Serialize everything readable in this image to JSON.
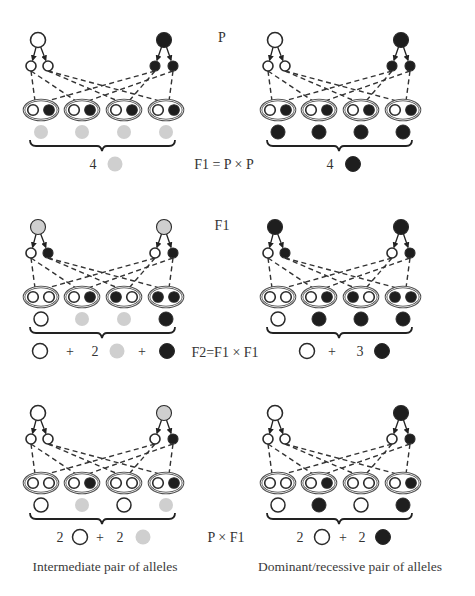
{
  "colors": {
    "white": "#ffffff",
    "grey": "#cfcfcf",
    "black": "#1e1e1e",
    "outline": "#2a2a2a",
    "ellipse_outline": "#4a4a4a",
    "line": "#333333"
  },
  "generation_labels": [
    {
      "id": "p",
      "text": "P"
    },
    {
      "id": "f1",
      "text": "F1"
    }
  ],
  "cross_labels": [
    {
      "id": "f1-equals-p-x-p",
      "text": "F1 = P × P"
    },
    {
      "id": "f2-equals-f1-x-f1",
      "text": "F2=F1 × F1"
    },
    {
      "id": "p-x-f1",
      "text": "P × F1"
    }
  ],
  "captions": [
    {
      "id": "intermediate",
      "text": "Intermediate pair of alleles"
    },
    {
      "id": "dominant-recessive",
      "text": "Dominant/recessive pair of alleles"
    }
  ],
  "panels": [
    {
      "id": "p-cross-intermediate",
      "parents": [
        "white",
        "black"
      ],
      "gametes": [
        "white",
        "white",
        "black",
        "black"
      ],
      "zygotes": [
        [
          "white",
          "black"
        ],
        [
          "white",
          "black"
        ],
        [
          "white",
          "black"
        ],
        [
          "white",
          "black"
        ]
      ],
      "phenotypes": [
        "grey",
        "grey",
        "grey",
        "grey"
      ],
      "summary": [
        {
          "type": "num",
          "text": "4"
        },
        {
          "type": "circle",
          "color": "grey"
        }
      ]
    },
    {
      "id": "p-cross-dominant",
      "parents": [
        "white",
        "black"
      ],
      "gametes": [
        "white",
        "white",
        "black",
        "black"
      ],
      "zygotes": [
        [
          "white",
          "black"
        ],
        [
          "white",
          "black"
        ],
        [
          "white",
          "black"
        ],
        [
          "white",
          "black"
        ]
      ],
      "phenotypes": [
        "black",
        "black",
        "black",
        "black"
      ],
      "summary": [
        {
          "type": "num",
          "text": "4"
        },
        {
          "type": "circle",
          "color": "black"
        }
      ]
    },
    {
      "id": "f1-cross-intermediate",
      "parents": [
        "grey",
        "grey"
      ],
      "gametes": [
        "white",
        "black",
        "white",
        "black"
      ],
      "zygotes": [
        [
          "white",
          "white"
        ],
        [
          "white",
          "black"
        ],
        [
          "black",
          "white"
        ],
        [
          "black",
          "black"
        ]
      ],
      "phenotypes": [
        "white",
        "grey",
        "grey",
        "black"
      ],
      "summary": [
        {
          "type": "circle",
          "color": "white"
        },
        {
          "type": "op",
          "text": "+"
        },
        {
          "type": "num",
          "text": "2"
        },
        {
          "type": "circle",
          "color": "grey"
        },
        {
          "type": "op",
          "text": "+"
        },
        {
          "type": "circle",
          "color": "black"
        }
      ]
    },
    {
      "id": "f1-cross-dominant",
      "parents": [
        "black",
        "black"
      ],
      "gametes": [
        "white",
        "black",
        "white",
        "black"
      ],
      "zygotes": [
        [
          "white",
          "white"
        ],
        [
          "white",
          "black"
        ],
        [
          "black",
          "white"
        ],
        [
          "black",
          "black"
        ]
      ],
      "phenotypes": [
        "white",
        "black",
        "black",
        "black"
      ],
      "summary": [
        {
          "type": "circle",
          "color": "white"
        },
        {
          "type": "op",
          "text": "+"
        },
        {
          "type": "num",
          "text": "3"
        },
        {
          "type": "circle",
          "color": "black"
        }
      ]
    },
    {
      "id": "backcross-intermediate",
      "parents": [
        "white",
        "grey"
      ],
      "gametes": [
        "white",
        "white",
        "white",
        "black"
      ],
      "zygotes": [
        [
          "white",
          "white"
        ],
        [
          "white",
          "black"
        ],
        [
          "white",
          "white"
        ],
        [
          "white",
          "black"
        ]
      ],
      "phenotypes": [
        "white",
        "grey",
        "white",
        "grey"
      ],
      "summary": [
        {
          "type": "num",
          "text": "2"
        },
        {
          "type": "circle",
          "color": "white"
        },
        {
          "type": "op",
          "text": "+"
        },
        {
          "type": "num",
          "text": "2"
        },
        {
          "type": "circle",
          "color": "grey"
        }
      ]
    },
    {
      "id": "backcross-dominant",
      "parents": [
        "white",
        "black"
      ],
      "gametes": [
        "white",
        "white",
        "white",
        "black"
      ],
      "zygotes": [
        [
          "white",
          "white"
        ],
        [
          "white",
          "black"
        ],
        [
          "white",
          "white"
        ],
        [
          "white",
          "black"
        ]
      ],
      "phenotypes": [
        "white",
        "black",
        "white",
        "black"
      ],
      "summary": [
        {
          "type": "num",
          "text": "2"
        },
        {
          "type": "circle",
          "color": "white"
        },
        {
          "type": "op",
          "text": "+"
        },
        {
          "type": "num",
          "text": "2"
        },
        {
          "type": "circle",
          "color": "black"
        }
      ]
    }
  ]
}
